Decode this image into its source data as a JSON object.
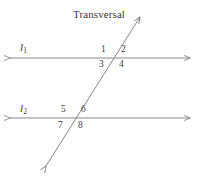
{
  "figure": {
    "title_label": "Transversal",
    "background_color": "#ffffff",
    "stroke_color": "#7d7d85",
    "text_color": "#3a3a3a",
    "lines": [
      {
        "name": "l",
        "subscript": "1",
        "label_x": 20,
        "label_y": 42,
        "y": 58,
        "x_start": 8,
        "x_end": 192
      },
      {
        "name": "l",
        "subscript": "2",
        "label_x": 20,
        "label_y": 103,
        "y": 118,
        "x_start": 8,
        "x_end": 192
      }
    ],
    "transversal": {
      "label": "Transversal",
      "label_x": 73,
      "label_y": 9,
      "x1": 44,
      "y1": 169,
      "x2": 142,
      "y2": 14,
      "arrow_start": "down-left",
      "arrow_end": "up-right"
    },
    "intersections": [
      {
        "id": "top",
        "x": 112,
        "y": 58
      },
      {
        "id": "bottom",
        "x": 72,
        "y": 118
      }
    ],
    "angles": [
      {
        "id": "1",
        "label": "1",
        "x": 101,
        "y": 45,
        "position": "upper-left-top-intersection"
      },
      {
        "id": "2",
        "label": "2",
        "x": 121,
        "y": 45,
        "position": "upper-right-top-intersection"
      },
      {
        "id": "3",
        "label": "3",
        "x": 99,
        "y": 60,
        "position": "lower-left-top-intersection"
      },
      {
        "id": "4",
        "label": "4",
        "x": 119,
        "y": 60,
        "position": "lower-right-top-intersection"
      },
      {
        "id": "5",
        "label": "5",
        "x": 61,
        "y": 105,
        "position": "upper-left-bottom-intersection"
      },
      {
        "id": "6",
        "label": "6",
        "x": 81,
        "y": 105,
        "position": "upper-right-bottom-intersection"
      },
      {
        "id": "7",
        "label": "7",
        "x": 58,
        "y": 121,
        "position": "lower-left-bottom-intersection"
      },
      {
        "id": "8",
        "label": "8",
        "x": 78,
        "y": 121,
        "position": "lower-right-bottom-intersection"
      }
    ]
  }
}
